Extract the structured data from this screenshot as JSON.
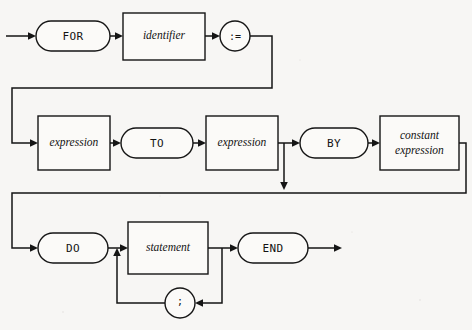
{
  "diagram": {
    "kind": "railroad-syntax-diagram",
    "background_color": "#f7f6f4",
    "line_color": "#151515",
    "node_fill": "#fbfaf8",
    "rows": [
      {
        "row": 1,
        "nodes": [
          {
            "id": "for",
            "label": "FOR",
            "shape": "stadium",
            "style": "terminal"
          },
          {
            "id": "identifier",
            "label": "identifier",
            "shape": "rect",
            "style": "nonterminal"
          },
          {
            "id": "assign",
            "label": ":=",
            "shape": "circle",
            "style": "terminal"
          }
        ]
      },
      {
        "row": 2,
        "nodes": [
          {
            "id": "expression1",
            "label": "expression",
            "shape": "rect",
            "style": "nonterminal"
          },
          {
            "id": "to",
            "label": "TO",
            "shape": "stadium",
            "style": "terminal"
          },
          {
            "id": "expression2",
            "label": "expression",
            "shape": "rect",
            "style": "nonterminal"
          },
          {
            "id": "by",
            "label": "BY",
            "shape": "stadium",
            "style": "terminal"
          },
          {
            "id": "constant_expression",
            "label": "constant expression",
            "label_line1": "constant",
            "label_line2": "expression",
            "shape": "rect",
            "style": "nonterminal"
          }
        ]
      },
      {
        "row": 3,
        "nodes": [
          {
            "id": "do",
            "label": "DO",
            "shape": "stadium",
            "style": "terminal"
          },
          {
            "id": "statement",
            "label": "statement",
            "shape": "rect",
            "style": "nonterminal"
          },
          {
            "id": "semicolon",
            "label": ";",
            "shape": "circle",
            "style": "terminal"
          },
          {
            "id": "end",
            "label": "END",
            "shape": "stadium",
            "style": "terminal"
          }
        ]
      }
    ],
    "paths": [
      {
        "id": "entry-arrow",
        "desc": "entry arrow into FOR"
      },
      {
        "id": "wrap-row1-to-row2",
        "desc": "line from := wraps down and left to expression"
      },
      {
        "id": "by-bypass",
        "desc": "optional BY clause bypass from after second expression down to wrap rail"
      },
      {
        "id": "wrap-row2-to-row3",
        "desc": "line from constant expression wraps down and left to DO"
      },
      {
        "id": "statement-loop",
        "desc": "loop back through semicolon to repeat statement"
      },
      {
        "id": "exit-arrow",
        "desc": "exit arrow after END"
      }
    ]
  }
}
